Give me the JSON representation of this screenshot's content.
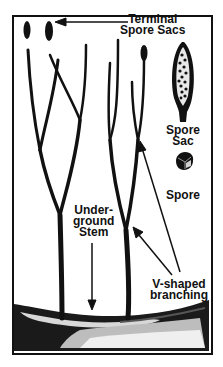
{
  "diagram": {
    "labels": {
      "terminal_spore_sacs": [
        "Terminal",
        "Spore Sacs"
      ],
      "spore_sac": [
        "Spore",
        "Sac"
      ],
      "spore": "Spore",
      "underground_stem": [
        "Under-",
        "ground",
        "Stem"
      ],
      "v_shaped_branching": [
        "V-shaped",
        "branching"
      ]
    },
    "colors": {
      "ink": "#111111",
      "background": "#ffffff",
      "spore_sac_fill": "#e8e8e8"
    }
  }
}
